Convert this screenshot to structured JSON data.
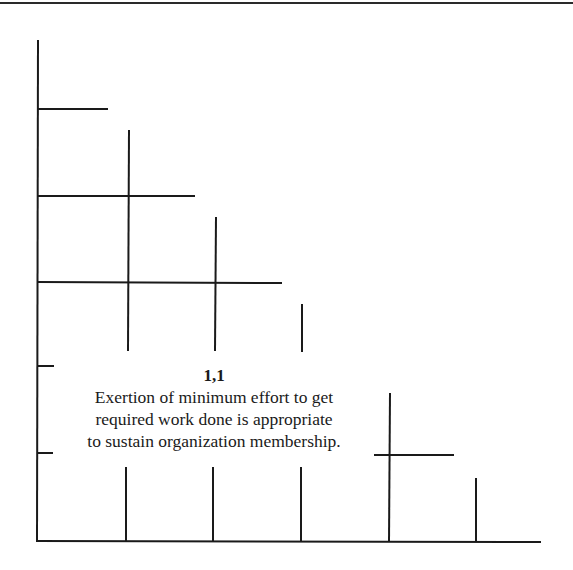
{
  "diagram": {
    "cell_label": "1,1",
    "description_lines": [
      "Exertion of minimum effort to get",
      "required work done is appropriate",
      "to sustain organization membership."
    ],
    "line_color": "#1a1a1a",
    "background": "#ffffff"
  }
}
